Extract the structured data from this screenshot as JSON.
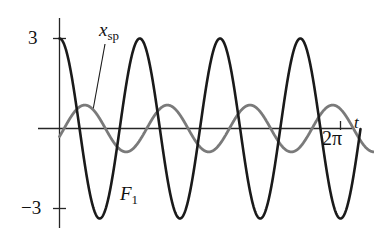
{
  "figure": {
    "title": "",
    "background_color": "#ffffff"
  },
  "axes": {
    "y_axis": {
      "name": "vertical-axis",
      "ticks": [
        {
          "value": 3,
          "label": "3"
        },
        {
          "value": -3,
          "label": "−3"
        }
      ],
      "color": "#222222"
    },
    "x_axis": {
      "name": "horizontal-axis",
      "label": "t",
      "ticks": [
        {
          "value": 6.2832,
          "label": "2π"
        }
      ],
      "color": "#222222"
    }
  },
  "annotations": [
    {
      "id": "xsp",
      "text_main": "x",
      "text_sub": "sp",
      "kind": "curve-label",
      "target": "x_sp_curve",
      "leader": true
    },
    {
      "id": "f1",
      "text_main": "F",
      "text_sub": "1",
      "kind": "curve-label",
      "target": "f1_curve",
      "leader": false
    }
  ],
  "chart_data": {
    "type": "line",
    "title": "",
    "xlabel": "t",
    "ylabel": "",
    "xlim": [
      0,
      7.05
    ],
    "ylim": [
      -3.6,
      3.6
    ],
    "grid": false,
    "legend": "inline-annotations",
    "yticks": [
      3,
      -3
    ],
    "ytick_labels": [
      "3",
      "−3"
    ],
    "xticks": [
      6.2832
    ],
    "xtick_labels": [
      "2π"
    ],
    "series": [
      {
        "name": "F_1",
        "display_label": "F₁",
        "color": "#1a1a1a",
        "linewidth": 2.6,
        "form": "cosine",
        "amplitude": 3.0,
        "period": 1.795,
        "omega": 3.5,
        "phase": 0.0,
        "offset": 0.0,
        "description": "Forcing function, amplitude 3, starts at maximum +3 at t=0, about 3.5 full cycles shown",
        "x": [
          0.0,
          0.18,
          0.36,
          0.54,
          0.72,
          0.9,
          1.08,
          1.26,
          1.44,
          1.62,
          1.8,
          1.98,
          2.16,
          2.34,
          2.52,
          2.7,
          2.88,
          3.06,
          3.24,
          3.42,
          3.6,
          3.78,
          3.96,
          4.14,
          4.32,
          4.5,
          4.68,
          4.86,
          5.04,
          5.22,
          5.4,
          5.58,
          5.76,
          5.94,
          6.12,
          6.3,
          6.48,
          6.66,
          6.84,
          7.02
        ],
        "y": [
          3.0,
          2.45,
          0.97,
          -0.89,
          -2.41,
          -2.99,
          -2.5,
          -1.06,
          0.81,
          2.37,
          3.0,
          2.54,
          1.14,
          -0.73,
          -2.32,
          -3.0,
          -2.58,
          -1.22,
          0.65,
          2.27,
          3.0,
          2.62,
          1.3,
          -0.57,
          -2.22,
          -2.99,
          -2.66,
          -1.38,
          0.49,
          2.16,
          2.99,
          2.7,
          1.46,
          -0.4,
          -2.11,
          -2.98,
          -2.73,
          -1.54,
          0.32,
          2.05
        ]
      },
      {
        "name": "x_sp",
        "display_label": "x_sp",
        "color": "#7a7a7a",
        "linewidth": 2.8,
        "form": "sine",
        "amplitude": 0.78,
        "period": 1.85,
        "omega": 3.4,
        "phase": -0.35,
        "offset": 0.0,
        "description": "Steady-state particular solution, small amplitude about 0.8, slightly out of phase with the forcing, starts just below zero and rises",
        "x": [
          0.0,
          0.18,
          0.36,
          0.54,
          0.72,
          0.9,
          1.08,
          1.26,
          1.44,
          1.62,
          1.8,
          1.98,
          2.16,
          2.34,
          2.52,
          2.7,
          2.88,
          3.06,
          3.24,
          3.42,
          3.6,
          3.78,
          3.96,
          4.14,
          4.32,
          4.5,
          4.68,
          4.86,
          5.04,
          5.22,
          5.4,
          5.58,
          5.76,
          5.94,
          6.12,
          6.3,
          6.48,
          6.66,
          6.84,
          7.02
        ],
        "y": [
          -0.27,
          0.21,
          0.59,
          0.77,
          0.72,
          0.45,
          0.05,
          -0.36,
          -0.66,
          -0.78,
          -0.67,
          -0.38,
          0.03,
          0.43,
          0.7,
          0.78,
          0.63,
          0.3,
          -0.11,
          -0.49,
          -0.73,
          -0.77,
          -0.58,
          -0.23,
          0.19,
          0.55,
          0.75,
          0.73,
          0.52,
          0.15,
          -0.26,
          -0.6,
          -0.77,
          -0.71,
          -0.44,
          -0.06,
          0.34,
          0.65,
          0.78,
          0.68
        ]
      }
    ]
  }
}
